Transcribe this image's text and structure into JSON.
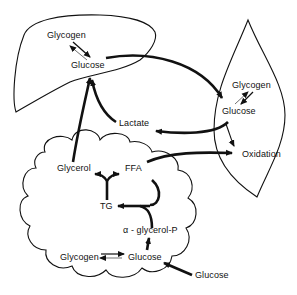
{
  "diagram": {
    "type": "metabolic-pathway",
    "compartments": [
      "liver",
      "muscle",
      "adipose-tissue"
    ],
    "liver": {
      "labels": {
        "glycogen": "Glycogen",
        "glucose": "Glucose"
      }
    },
    "muscle": {
      "labels": {
        "glycogen": "Glycogen",
        "glucose": "Glucose"
      }
    },
    "adipose": {
      "labels": {
        "glycerol": "Glycerol",
        "ffa": "FFA",
        "tg": "TG",
        "alpha_glycerol_p": "α - glycerol-P",
        "glycogen": "Glycogen",
        "glucose": "Glucose"
      }
    },
    "external": {
      "lactate": "Lactate",
      "oxidation": "Oxidation",
      "glucose_input": "Glucose"
    },
    "arrows": [
      {
        "from": "liver.glucose",
        "to": "muscle.glucose"
      },
      {
        "from": "muscle.glucose",
        "to": "lactate"
      },
      {
        "from": "lactate",
        "to": "liver.glucose"
      },
      {
        "from": "muscle.glucose",
        "to": "oxidation"
      },
      {
        "from": "adipose.ffa",
        "to": "oxidation"
      },
      {
        "from": "adipose.glycerol",
        "to": "liver.glucose"
      },
      {
        "from": "adipose.tg",
        "to": "adipose.glycerol"
      },
      {
        "from": "adipose.tg",
        "to": "adipose.ffa"
      },
      {
        "from": "adipose.ffa",
        "to": "adipose.tg"
      },
      {
        "from": "adipose.alpha_glycerol_p",
        "to": "adipose.tg"
      },
      {
        "from": "adipose.glucose",
        "to": "adipose.alpha_glycerol_p"
      },
      {
        "from": "external.glucose",
        "to": "adipose.glucose"
      },
      {
        "from": "liver.glycogen",
        "to": "liver.glucose",
        "reversible": true
      },
      {
        "from": "muscle.glycogen",
        "to": "muscle.glucose",
        "reversible": true
      },
      {
        "from": "adipose.glycogen",
        "to": "adipose.glucose",
        "reversible": true
      }
    ]
  }
}
